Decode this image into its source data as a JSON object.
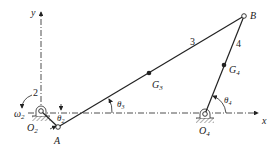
{
  "diagram": {
    "axes": {
      "x_label": "x",
      "y_label": "y"
    },
    "links": [
      {
        "id": "2",
        "label": "2"
      },
      {
        "id": "3",
        "label": "3"
      },
      {
        "id": "4",
        "label": "4"
      }
    ],
    "points": {
      "O2": {
        "main": "O",
        "sub": "2"
      },
      "O4": {
        "main": "O",
        "sub": "4"
      },
      "A": {
        "main": "A",
        "sub": ""
      },
      "B": {
        "main": "B",
        "sub": ""
      },
      "G3": {
        "main": "G",
        "sub": "3"
      },
      "G4": {
        "main": "G",
        "sub": "4"
      }
    },
    "angles": {
      "theta2": {
        "main": "θ",
        "sub": "2"
      },
      "theta3": {
        "main": "θ",
        "sub": "3"
      },
      "theta4": {
        "main": "θ",
        "sub": "4"
      }
    },
    "angular_velocity": {
      "main": "ω",
      "sub": "2"
    },
    "colors": {
      "ink": "#222222",
      "ground_hatch": "#777777",
      "background": "#ffffff"
    }
  }
}
